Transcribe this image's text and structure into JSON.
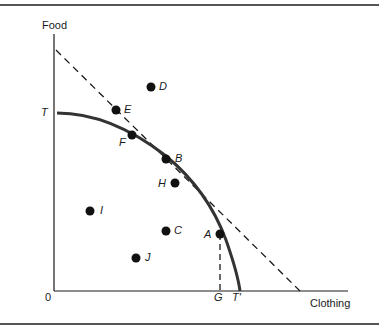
{
  "figure": {
    "axes": {
      "y_label": "Food",
      "x_label": "Clothing",
      "origin_label": "0"
    },
    "curve_labels": {
      "ppf_top": "T",
      "ppf_bottom": "T'",
      "g_label": "G"
    },
    "points": [
      {
        "id": "D",
        "label": "D"
      },
      {
        "id": "E",
        "label": "E"
      },
      {
        "id": "F",
        "label": "F"
      },
      {
        "id": "B",
        "label": "B"
      },
      {
        "id": "H",
        "label": "H"
      },
      {
        "id": "A",
        "label": "A"
      },
      {
        "id": "C",
        "label": "C"
      },
      {
        "id": "I",
        "label": "I"
      },
      {
        "id": "J",
        "label": "J"
      }
    ],
    "colors": {
      "ink": "#1a1a1a",
      "rule": "#555555",
      "background": "#ffffff"
    }
  }
}
